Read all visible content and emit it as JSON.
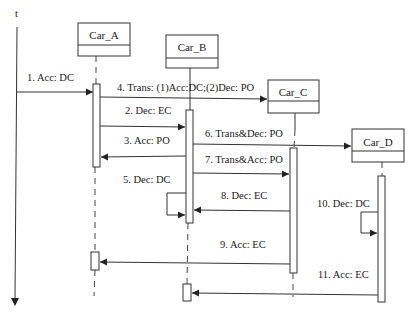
{
  "diagram": {
    "type": "sequence",
    "time_axis": {
      "label": "t"
    },
    "objects": [
      {
        "name": "Car_A"
      },
      {
        "name": "Car_B"
      },
      {
        "name": "Car_C"
      },
      {
        "name": "Car_D"
      }
    ],
    "messages": [
      {
        "label": "1. Acc: DC",
        "from": "external",
        "to": "Car_A"
      },
      {
        "label": "2. Dec: EC",
        "from": "Car_A",
        "to": "Car_B"
      },
      {
        "label": "3. Acc: PO",
        "from": "Car_B",
        "to": "Car_A"
      },
      {
        "label": "4. Trans: (1)Acc:DC;(2)Dec: PO",
        "from": "Car_A",
        "to": "Car_C"
      },
      {
        "label": "5. Dec: DC",
        "from": "Car_B",
        "to": "Car_B"
      },
      {
        "label": "6. Trans&Dec: PO",
        "from": "Car_B",
        "to": "Car_D"
      },
      {
        "label": "7. Trans&Acc: PO",
        "from": "Car_B",
        "to": "Car_C"
      },
      {
        "label": "8. Dec: EC",
        "from": "Car_C",
        "to": "Car_B"
      },
      {
        "label": "9. Acc: EC",
        "from": "Car_C",
        "to": "Car_A"
      },
      {
        "label": "10. Dec: DC",
        "from": "Car_D",
        "to": "Car_D"
      },
      {
        "label": "11. Acc: EC",
        "from": "Car_D",
        "to": "Car_B"
      }
    ],
    "colors": {
      "line": "#333333",
      "text": "#1a1a1a",
      "background": "#ffffff"
    }
  }
}
